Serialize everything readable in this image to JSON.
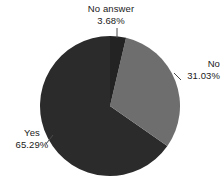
{
  "chart_data": {
    "type": "pie",
    "title": "",
    "subtitle": "",
    "xlabel": "",
    "ylabel": "",
    "legend_position": "none",
    "grid": false,
    "labels_show_percent": true,
    "categories": [
      "No answer",
      "No",
      "Yes"
    ],
    "values": [
      3.68,
      31.03,
      65.29
    ],
    "slices": [
      {
        "name": "No answer",
        "label": "No answer",
        "percent_text": "3.68%",
        "value": 3.68,
        "color": "#232323",
        "start_angle_deg": 0,
        "end_angle_deg": 13.25
      },
      {
        "name": "No",
        "label": "No",
        "percent_text": "31.03%",
        "value": 31.03,
        "color": "#6e6e6e",
        "start_angle_deg": 13.25,
        "end_angle_deg": 124.96
      },
      {
        "name": "Yes",
        "label": "Yes",
        "percent_text": "65.29%",
        "value": 65.29,
        "color": "#2b2b2b",
        "start_angle_deg": 124.96,
        "end_angle_deg": 360
      }
    ]
  },
  "colors": {
    "background": "#ffffff",
    "text": "#1a1a1a",
    "slice_no_answer": "#232323",
    "slice_no": "#6e6e6e",
    "slice_yes": "#2b2b2b",
    "leader_line": "#4a4a4a"
  },
  "labels": {
    "no_answer": {
      "name": "No answer",
      "percent": "3.68%"
    },
    "no": {
      "name": "No",
      "percent": "31.03%"
    },
    "yes": {
      "name": "Yes",
      "percent": "65.29%"
    }
  }
}
